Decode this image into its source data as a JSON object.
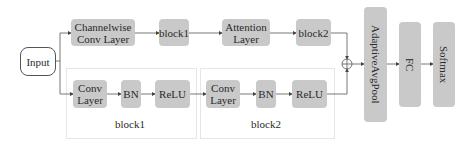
{
  "diagram": {
    "input": {
      "label": "Input"
    },
    "top_branch": [
      {
        "id": "channelwise-conv",
        "label_lines": [
          "Channelwise",
          "Conv Layer"
        ]
      },
      {
        "id": "block1",
        "label": "block1"
      },
      {
        "id": "attention",
        "label_lines": [
          "Attention",
          "Layer"
        ]
      },
      {
        "id": "block2",
        "label": "block2"
      }
    ],
    "bottom_branch": {
      "block1": {
        "label": "block1",
        "nodes": [
          {
            "id": "conv1",
            "label_lines": [
              "Conv",
              "Layer"
            ]
          },
          {
            "id": "bn1",
            "label": "BN"
          },
          {
            "id": "relu1",
            "label": "ReLU"
          }
        ]
      },
      "block2": {
        "label": "block2",
        "nodes": [
          {
            "id": "conv2",
            "label_lines": [
              "Conv",
              "Layer"
            ]
          },
          {
            "id": "bn2",
            "label": "BN"
          },
          {
            "id": "relu2",
            "label": "ReLU"
          }
        ]
      }
    },
    "merge": {
      "symbol": "⊕",
      "operation": "add"
    },
    "head": [
      {
        "id": "adaptive-avg-pool",
        "label": "AdaptiveAvgPool"
      },
      {
        "id": "fc",
        "label": "FC"
      },
      {
        "id": "softmax",
        "label": "Softmax"
      }
    ],
    "colors": {
      "node_fill": "#c9c9c9",
      "line": "#555555",
      "panel_border": "#e6e6e6",
      "background": "#ffffff"
    }
  }
}
